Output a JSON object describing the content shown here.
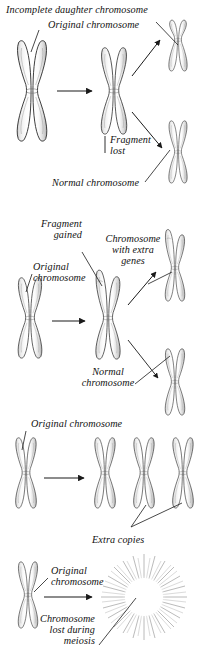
{
  "figure": {
    "background_color": "#ffffff",
    "ink_color": "#1a1a1a",
    "shading_color": "#8a8a8a",
    "width": 204,
    "height": 656
  },
  "panels": [
    {
      "id": "deletion",
      "name": "deletion-panel",
      "labels": {
        "incomplete_daughter": "Incomplete daughter chromosome",
        "original": "Original chromosome",
        "fragment_lost": "Fragment\nlost",
        "normal": "Normal chromosome"
      }
    },
    {
      "id": "duplication",
      "name": "duplication-panel",
      "labels": {
        "fragment_gained": "Fragment\ngained",
        "extra_genes": "Chromosome\nwith extra\ngenes",
        "original": "Original\nchromosome",
        "normal": "Normal\nchromosome"
      }
    },
    {
      "id": "trisomy",
      "name": "trisomy-panel",
      "labels": {
        "original": "Original chromosome",
        "extra_copies": "Extra copies"
      }
    },
    {
      "id": "monosomy",
      "name": "monosomy-panel",
      "labels": {
        "original": "Original\nchromosome",
        "lost_during_meiosis": "Chromosome\nlost during\nmeiosis"
      }
    }
  ],
  "labels": {
    "incomplete_daughter_chromosome": "Incomplete daughter chromosome",
    "original_chromosome_1": "Original chromosome",
    "fragment_lost_line1": "Fragment",
    "fragment_lost_line2": "lost",
    "normal_chromosome_1": "Normal chromosome",
    "fragment_gained_line1": "Fragment",
    "fragment_gained_line2": "gained",
    "extra_genes_line1": "Chromosome",
    "extra_genes_line2": "with extra",
    "extra_genes_line3": "genes",
    "original_chromosome_2_line1": "Original",
    "original_chromosome_2_line2": "chromosome",
    "normal_chromosome_2_line1": "Normal",
    "normal_chromosome_2_line2": "chromosome",
    "original_chromosome_3": "Original chromosome",
    "extra_copies": "Extra copies",
    "original_chromosome_4_line1": "Original",
    "original_chromosome_4_line2": "chromosome",
    "lost_meiosis_line1": "Chromosome",
    "lost_meiosis_line2": "lost during",
    "lost_meiosis_line3": "meiosis"
  }
}
